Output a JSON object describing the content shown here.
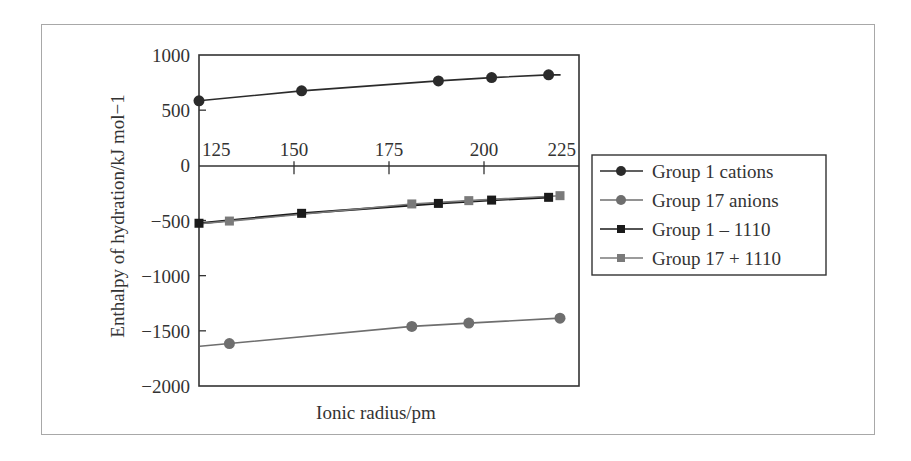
{
  "chart_data": {
    "type": "line",
    "title": "",
    "xlabel": "Ionic radius/pm",
    "ylabel": "Enthalpy of hydration/kJ mol−1",
    "xlim": [
      125,
      225
    ],
    "ylim": [
      -2000,
      1000
    ],
    "x_ticks": [
      "125",
      "150",
      "175",
      "200",
      "225"
    ],
    "y_ticks": [
      "1000",
      "500",
      "0",
      "−500",
      "−1000",
      "−1500",
      "−2000"
    ],
    "grid": false,
    "legend_position": "right",
    "series": [
      {
        "name": "Group 1 cations",
        "marker": "circle",
        "color": "#2b2b2b",
        "x": [
          125,
          152,
          188,
          202,
          217
        ],
        "y": [
          585,
          675,
          765,
          795,
          820
        ]
      },
      {
        "name": "Group 17 anions",
        "marker": "circle",
        "color": "#6e6e6e",
        "x": [
          133,
          181,
          196,
          220
        ],
        "y": [
          -1615,
          -1460,
          -1430,
          -1385
        ]
      },
      {
        "name": "Group 1 – 1110",
        "marker": "square",
        "color": "#1a1a1a",
        "x": [
          125,
          152,
          188,
          202,
          217
        ],
        "y": [
          -525,
          -435,
          -345,
          -315,
          -290
        ]
      },
      {
        "name": "Group 17 + 1110",
        "marker": "square",
        "color": "#7a7a7a",
        "x": [
          133,
          181,
          196,
          220
        ],
        "y": [
          -505,
          -350,
          -320,
          -275
        ]
      }
    ]
  },
  "axes": {
    "x_title": "Ionic radius/pm",
    "y_title": "Enthalpy of hydration/kJ mol−1",
    "x_tick_labels": [
      "125",
      "150",
      "175",
      "200",
      "225"
    ],
    "y_tick_labels": [
      "1000",
      "500",
      "0",
      "−500",
      "−1000",
      "−1500",
      "−2000"
    ]
  },
  "legend": {
    "items": [
      {
        "label": "Group 1 cations",
        "color": "#2b2b2b",
        "marker": "circle"
      },
      {
        "label": "Group 17 anions",
        "color": "#6e6e6e",
        "marker": "circle"
      },
      {
        "label": "Group 1 – 1110",
        "color": "#1a1a1a",
        "marker": "square"
      },
      {
        "label": "Group 17 + 1110",
        "color": "#7a7a7a",
        "marker": "square"
      }
    ]
  }
}
